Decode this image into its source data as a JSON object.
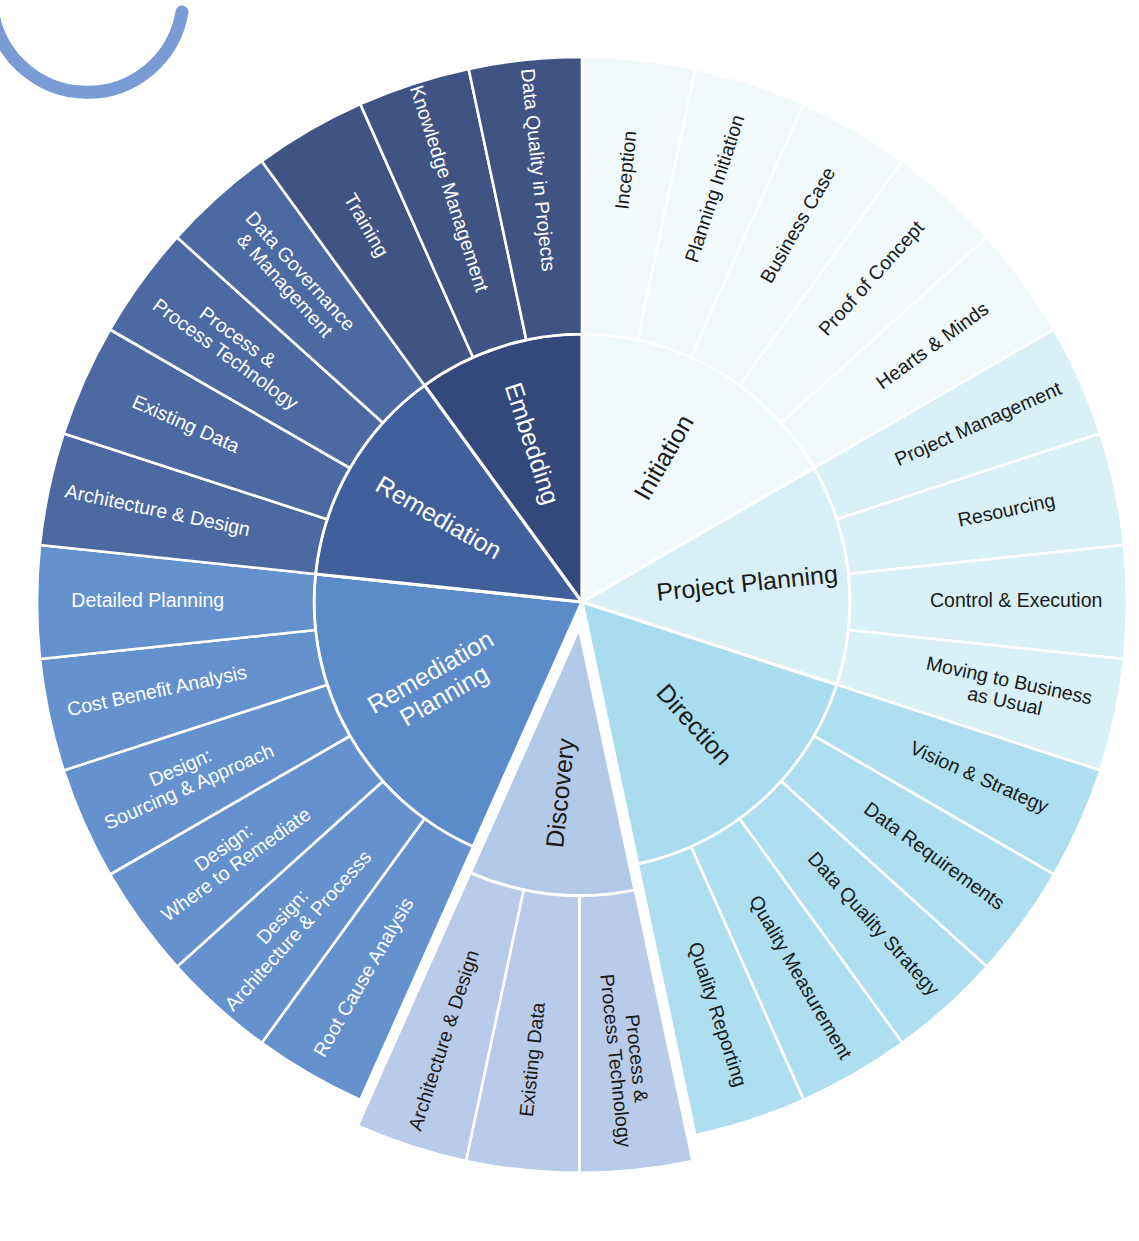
{
  "logo": {
    "name": "partial-ring-logo"
  },
  "colors": {
    "initiation": "#f0f9fb",
    "initiation_outer": "#f6fcfd",
    "project_planning": "#d6f0f5",
    "project_planning_outer": "#ddf3f7",
    "direction": "#a9dcef",
    "direction_outer": "#b2e0f1",
    "discovery": "#b3c9e8",
    "discovery_outer": "#bed1ec",
    "remediation_planning": "#5b8bc9",
    "remediation_planning_outer": "#6694cd",
    "remediation": "#41609b",
    "remediation_outer": "#4a6aa4",
    "embedding": "#33497b",
    "embedding_outer": "#3b5286",
    "stroke": "#ffffff",
    "text_dark": "#1a1a1a",
    "text_light": "#ffffff",
    "logo_blue": "#7b9bd4"
  },
  "chart_data": {
    "type": "pie",
    "subtype": "sunburst",
    "rings": 2,
    "center": [
      582,
      602
    ],
    "inner_radius": 0,
    "mid_radius": 268,
    "outer_radius": 545,
    "start_angle_deg": -90,
    "direction": "clockwise",
    "legend": "none",
    "grid": false,
    "segments": [
      {
        "label": "Initiation",
        "value": 5,
        "color": "#f0f9fb",
        "text_color": "#1a1a1a",
        "exploded": false,
        "children": [
          {
            "label": "Inception",
            "value": 1
          },
          {
            "label": "Planning Initiation",
            "value": 1
          },
          {
            "label": "Business Case",
            "value": 1
          },
          {
            "label": "Proof of Concept",
            "value": 1
          },
          {
            "label": "Hearts & Minds",
            "value": 1
          }
        ]
      },
      {
        "label": "Project Planning",
        "value": 4,
        "color": "#d6f0f5",
        "text_color": "#1a1a1a",
        "exploded": false,
        "children": [
          {
            "label": "Project Management",
            "value": 1
          },
          {
            "label": "Resourcing",
            "value": 1
          },
          {
            "label": "Control & Execution",
            "value": 1
          },
          {
            "label": "Moving to Business\nas Usual",
            "value": 1
          }
        ]
      },
      {
        "label": "Direction",
        "value": 5,
        "color": "#a9dcef",
        "text_color": "#1a1a1a",
        "exploded": false,
        "children": [
          {
            "label": "Vision & Strategy",
            "value": 1
          },
          {
            "label": "Data Requirements",
            "value": 1
          },
          {
            "label": "Data Quality Strategy",
            "value": 1
          },
          {
            "label": "Quality Measurement",
            "value": 1
          },
          {
            "label": "Quality Reporting",
            "value": 1
          }
        ]
      },
      {
        "label": "Discovery",
        "value": 3,
        "color": "#b3c9e8",
        "text_color": "#1a1a1a",
        "exploded": true,
        "children": [
          {
            "label": "Process &\nProcess Technology",
            "value": 1
          },
          {
            "label": "Existing Data",
            "value": 1
          },
          {
            "label": "Architecture & Design",
            "value": 1
          }
        ]
      },
      {
        "label": "Remediation\nPlanning",
        "value": 6,
        "color": "#5b8bc9",
        "text_color": "#ffffff",
        "exploded": false,
        "children": [
          {
            "label": "Root Cause Analysis",
            "value": 1
          },
          {
            "label": "Design:\nArchitecture & Processs",
            "value": 1
          },
          {
            "label": "Design:\nWhere to Remediate",
            "value": 1
          },
          {
            "label": "Design:\nSourcing & Approach",
            "value": 1
          },
          {
            "label": "Cost Benefit Analysis",
            "value": 1
          },
          {
            "label": "Detailed Planning",
            "value": 1
          }
        ]
      },
      {
        "label": "Remediation",
        "value": 4,
        "color": "#41609b",
        "text_color": "#ffffff",
        "exploded": false,
        "children": [
          {
            "label": "Architecture & Design",
            "value": 1
          },
          {
            "label": "Existing Data",
            "value": 1
          },
          {
            "label": "Process &\nProcess Technology",
            "value": 1
          },
          {
            "label": "Data Governance\n& Management",
            "value": 1
          }
        ]
      },
      {
        "label": "Embedding",
        "value": 3,
        "color": "#33497b",
        "text_color": "#ffffff",
        "exploded": false,
        "children": [
          {
            "label": "Training",
            "value": 1
          },
          {
            "label": "Knowledge Management",
            "value": 1
          },
          {
            "label": "Data Quality in Projects",
            "value": 1
          }
        ]
      }
    ]
  }
}
